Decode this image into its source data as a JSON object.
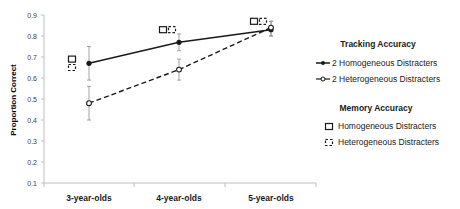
{
  "chart_data": {
    "type": "line",
    "title": "",
    "xlabel": "",
    "ylabel": "Proportion Correct",
    "ylim": [
      0.1,
      0.9
    ],
    "yticks": [
      "0.1",
      "0.2",
      "0.3",
      "0.4",
      "0.5",
      "0.6",
      "0.7",
      "0.8",
      "0.9"
    ],
    "grid": false,
    "legend_position": "right",
    "categories": [
      "3-year-olds",
      "4-year-olds",
      "5-year-olds"
    ],
    "series": [
      {
        "name": "2 Homogeneous Distracters",
        "group": "Tracking Accuracy",
        "style": "solid line, filled circle",
        "values": [
          0.67,
          0.77,
          0.83
        ],
        "error_low": [
          0.59,
          0.73,
          0.8
        ],
        "error_high": [
          0.75,
          0.81,
          0.87
        ]
      },
      {
        "name": "2 Heterogeneous Distracters",
        "group": "Tracking Accuracy",
        "style": "dashed line, open circle",
        "values": [
          0.48,
          0.64,
          0.84
        ],
        "error_low": [
          0.4,
          0.59,
          0.8
        ],
        "error_high": [
          0.56,
          0.69,
          0.87
        ]
      },
      {
        "name": "Homogeneous Distracters",
        "group": "Memory Accuracy",
        "style": "open square marker",
        "values": [
          0.69,
          0.83,
          0.87
        ]
      },
      {
        "name": "Heterogeneous Distracters",
        "group": "Memory Accuracy",
        "style": "dashed square marker",
        "values": [
          0.65,
          0.83,
          0.87
        ]
      }
    ]
  },
  "legend": {
    "tracking_title": "Tracking Accuracy",
    "tracking_items": [
      "2 Homogeneous Distracters",
      "2 Heterogeneous Distracters"
    ],
    "memory_title": "Memory Accuracy",
    "memory_items": [
      "Homogeneous Distracters",
      "Heterogeneous Distracters"
    ]
  },
  "axis": {
    "ylabel": "Proportion Correct",
    "yticks": [
      "0.1",
      "0.2",
      "0.3",
      "0.4",
      "0.5",
      "0.6",
      "0.7",
      "0.8",
      "0.9"
    ],
    "categories": [
      "3-year-olds",
      "4-year-olds",
      "5-year-olds"
    ]
  }
}
